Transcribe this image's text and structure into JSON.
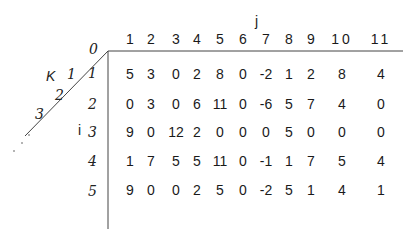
{
  "table": {
    "col_axis_label": "j",
    "row_axis_label": "i",
    "diag_axis_label": "K",
    "col_headers": [
      "1",
      "2",
      "3",
      "4",
      "5",
      "6",
      "7",
      "8",
      "9",
      "10",
      "11"
    ],
    "corner_zero": "0",
    "diag_ticks": [
      "1",
      "2",
      "3",
      "..."
    ],
    "row_headers": [
      "1",
      "2",
      "3",
      "4",
      "5"
    ],
    "rows": [
      [
        "5",
        "3",
        "0",
        "2",
        "8",
        "0",
        "-2",
        "1",
        "2",
        "8",
        "4"
      ],
      [
        "0",
        "3",
        "0",
        "6",
        "11",
        "0",
        "-6",
        "5",
        "7",
        "4",
        "0"
      ],
      [
        "9",
        "0",
        "12",
        "2",
        "0",
        "0",
        "0",
        "5",
        "0",
        "0",
        "0"
      ],
      [
        "1",
        "7",
        "5",
        "5",
        "11",
        "0",
        "-1",
        "1",
        "7",
        "5",
        "4"
      ],
      [
        "9",
        "0",
        "0",
        "2",
        "5",
        "0",
        "-2",
        "5",
        "1",
        "4",
        "1"
      ]
    ]
  }
}
